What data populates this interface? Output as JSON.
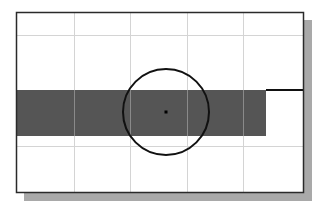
{
  "diagram": {
    "colors": {
      "background": "#ffffff",
      "frame_border": "#2a2a2a",
      "shadow": "#a9a9a9",
      "grid_line": "#d4d4d4",
      "filled_bar": "#555555",
      "circle_stroke": "#111111",
      "center_point": "#000000",
      "extension_line": "#111111"
    },
    "frame": {
      "x": 16,
      "y": 12,
      "width": 288,
      "height": 181
    },
    "shadow": {
      "offset_x": 8,
      "offset_y": 8
    },
    "grid": {
      "vertical_x": [
        74,
        130,
        187,
        243
      ],
      "horizontal_y": [
        35,
        146
      ]
    },
    "bar": {
      "x": 17,
      "y": 90,
      "width": 249,
      "height": 46
    },
    "circle": {
      "cx": 166,
      "cy": 112,
      "r": 43
    },
    "center_point": {
      "cx": 166,
      "cy": 112,
      "size": 3
    },
    "extension_line": {
      "x1": 266,
      "y1": 90,
      "x2": 304,
      "y2": 90
    }
  }
}
